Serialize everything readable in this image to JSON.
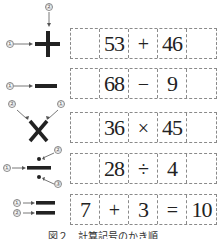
{
  "figure": {
    "caption": "図２　計算記号のかき順"
  },
  "symbols": [
    {
      "name": "plus",
      "glyph": "+",
      "strokes": [
        "①",
        "②"
      ]
    },
    {
      "name": "minus",
      "glyph": "−",
      "strokes": [
        "①"
      ]
    },
    {
      "name": "times",
      "glyph": "×",
      "strokes": [
        "②",
        "①"
      ]
    },
    {
      "name": "divide",
      "glyph": "÷",
      "strokes": [
        "①",
        "②",
        "③"
      ]
    },
    {
      "name": "equals",
      "glyph": "=",
      "strokes": [
        "①",
        "②"
      ]
    }
  ],
  "rows": [
    {
      "cells": [
        "",
        "53",
        "+",
        "46",
        ""
      ]
    },
    {
      "cells": [
        "",
        "68",
        "−",
        "9",
        ""
      ]
    },
    {
      "cells": [
        "",
        "36",
        "×",
        "45",
        ""
      ]
    },
    {
      "cells": [
        "",
        "28",
        "÷",
        "4",
        ""
      ]
    },
    {
      "cells": [
        "7",
        "+",
        "3",
        "=",
        "10"
      ]
    }
  ],
  "colors": {
    "stroke": "#222222",
    "arrow": "#555555",
    "grid_border": "#8a8a8a"
  }
}
